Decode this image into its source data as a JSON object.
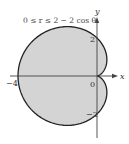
{
  "chart_data": {
    "type": "area",
    "title": "0 ≤ r ≤ 2 − 2 cos θ",
    "curve": "polar r = 2 - 2cos(theta), theta in [0, 2pi]",
    "xlabel": "x",
    "ylabel": "y",
    "x_ticks": [
      {
        "value": -4,
        "label": "−4"
      },
      {
        "value": 0,
        "label": "0"
      }
    ],
    "y_ticks": [
      {
        "value": 2,
        "label": "2"
      },
      {
        "value": -2,
        "label": "−2"
      }
    ],
    "xlim": [
      -4.4,
      1.0
    ],
    "ylim": [
      -3.1,
      3.0
    ],
    "grid": false,
    "fill_color": "#d4d4d4",
    "stroke_color": "#222222",
    "axis_color": "#444444"
  }
}
